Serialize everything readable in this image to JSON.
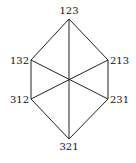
{
  "diagram": {
    "type": "hexagon-graph",
    "vertices": [
      {
        "id": "v123",
        "label": "123",
        "x": 69,
        "y": 19,
        "lx": 69,
        "ly": 14,
        "anchor": "middle"
      },
      {
        "id": "v132",
        "label": "132",
        "x": 31,
        "y": 60,
        "lx": 29,
        "ly": 64,
        "anchor": "end"
      },
      {
        "id": "v213",
        "label": "213",
        "x": 108,
        "y": 60,
        "lx": 110,
        "ly": 64,
        "anchor": "start"
      },
      {
        "id": "v312",
        "label": "312",
        "x": 31,
        "y": 99,
        "lx": 29,
        "ly": 103,
        "anchor": "end"
      },
      {
        "id": "v231",
        "label": "231",
        "x": 108,
        "y": 99,
        "lx": 110,
        "ly": 103,
        "anchor": "start"
      },
      {
        "id": "v321",
        "label": "321",
        "x": 69,
        "y": 139,
        "lx": 69,
        "ly": 150,
        "anchor": "middle"
      }
    ],
    "edges": [
      [
        "v123",
        "v132"
      ],
      [
        "v123",
        "v213"
      ],
      [
        "v132",
        "v312"
      ],
      [
        "v213",
        "v231"
      ],
      [
        "v312",
        "v321"
      ],
      [
        "v231",
        "v321"
      ],
      [
        "v123",
        "v321"
      ],
      [
        "v132",
        "v231"
      ],
      [
        "v213",
        "v312"
      ]
    ],
    "colors": {
      "line": "#222222",
      "text": "#111111",
      "background": "#ffffff"
    }
  }
}
